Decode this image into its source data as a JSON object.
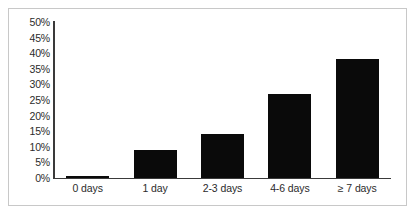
{
  "chart_data": {
    "type": "bar",
    "title": "",
    "xlabel": "",
    "ylabel": "",
    "categories": [
      "0 days",
      "1 day",
      "2-3 days",
      "4-6 days",
      "≥ 7 days"
    ],
    "values": [
      0.5,
      9,
      14,
      27,
      38
    ],
    "ylim": [
      0,
      50
    ],
    "yticks": [
      "0%",
      "5%",
      "10%",
      "15%",
      "20%",
      "25%",
      "30%",
      "35%",
      "40%",
      "45%",
      "50%"
    ],
    "ytick_values": [
      0,
      5,
      10,
      15,
      20,
      25,
      30,
      35,
      40,
      45,
      50
    ],
    "grid": false,
    "legend": false,
    "bar_color": "#0a0a0a",
    "axis_color": "#3a3a3a",
    "frame_color": "#c8c8c8",
    "background": "#ffffff"
  }
}
